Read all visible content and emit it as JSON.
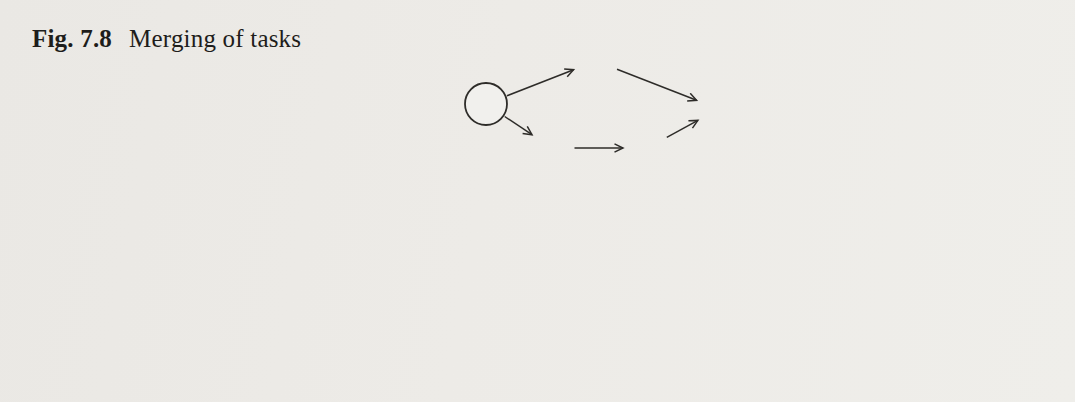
{
  "figure": {
    "label": "Fig. 7.8",
    "caption": "Merging of tasks"
  },
  "colors": {
    "paper": "#edebe7",
    "ink": "#2e2c29",
    "label_ink": "#232220",
    "caption_ink": "#1e1d1b",
    "ghost": "#8a8781"
  },
  "token_dot_radius": 7,
  "graphs": [
    {
      "id": "top-source",
      "nodes": [
        {
          "id": "t1",
          "kind": "task",
          "tau": "τ",
          "sub": "1",
          "sup": "",
          "x": 486,
          "y": 104,
          "r": 21
        },
        {
          "id": "t2",
          "kind": "task",
          "tau": "τ",
          "sub": "2",
          "sup": "",
          "x": 596,
          "y": 61,
          "r": 21
        },
        {
          "id": "t3",
          "kind": "task",
          "tau": "τ",
          "sub": "3",
          "sup": "",
          "x": 552,
          "y": 148,
          "r": 21
        },
        {
          "id": "t4",
          "kind": "task",
          "tau": "τ",
          "sub": "4",
          "sup": "",
          "x": 647,
          "y": 148,
          "r": 21
        },
        {
          "id": "t5",
          "kind": "task",
          "tau": "τ",
          "sub": "5",
          "sup": "",
          "x": 719,
          "y": 109,
          "r": 21
        }
      ],
      "edges": [
        [
          "t1",
          "t2"
        ],
        [
          "t1",
          "t3"
        ],
        [
          "t2",
          "t5"
        ],
        [
          "t3",
          "t4"
        ],
        [
          "t4",
          "t5"
        ]
      ]
    },
    {
      "id": "top-result",
      "nodes": [
        {
          "id": "t1",
          "kind": "task",
          "tau": "τ",
          "sub": "1",
          "sup": "",
          "x": 858,
          "y": 106,
          "r": 21
        },
        {
          "id": "t2",
          "kind": "task",
          "tau": "τ",
          "sub": "2",
          "sup": "",
          "x": 939,
          "y": 62,
          "r": 21
        },
        {
          "id": "t3s",
          "kind": "task",
          "tau": "τ",
          "sub": "3",
          "sup": "*",
          "x": 937,
          "y": 152,
          "r": 21
        },
        {
          "id": "t5",
          "kind": "task",
          "tau": "τ",
          "sub": "5",
          "sup": "",
          "x": 1017,
          "y": 107,
          "r": 21
        }
      ],
      "edges": [
        [
          "t1",
          "t2"
        ],
        [
          "t1",
          "t3s"
        ],
        [
          "t2",
          "t5"
        ],
        [
          "t3s",
          "t5"
        ]
      ]
    },
    {
      "id": "bottom-source",
      "nodes": [
        {
          "id": "token",
          "kind": "token",
          "x": 285,
          "y": 221,
          "r": 17
        },
        {
          "id": "t1",
          "kind": "task",
          "tau": "τ",
          "sub": "1",
          "sup": "",
          "x": 220,
          "y": 317,
          "r": 22
        },
        {
          "id": "t2",
          "kind": "task",
          "tau": "τ",
          "sub": "2",
          "sup": "",
          "x": 338,
          "y": 271,
          "r": 22
        },
        {
          "id": "t3",
          "kind": "task",
          "tau": "τ",
          "sub": "3",
          "sup": "",
          "x": 285,
          "y": 361,
          "r": 22
        },
        {
          "id": "t4",
          "kind": "task",
          "tau": "τ",
          "sub": "4",
          "sup": "",
          "x": 388,
          "y": 363,
          "r": 22
        },
        {
          "id": "t5",
          "kind": "task",
          "tau": "τ",
          "sub": "5",
          "sup": "",
          "x": 466,
          "y": 320,
          "r": 22
        }
      ],
      "edges": [
        [
          "token",
          "t2"
        ],
        [
          "t1",
          "t2"
        ],
        [
          "t1",
          "t3"
        ],
        [
          "t2",
          "t5"
        ],
        [
          "t3",
          "t4"
        ],
        [
          "t4",
          "t5"
        ]
      ]
    },
    {
      "id": "bottom-result",
      "nodes": [
        {
          "id": "token",
          "kind": "token",
          "x": 721,
          "y": 226,
          "r": 17
        },
        {
          "id": "t1",
          "kind": "task",
          "tau": "τ",
          "sub": "1",
          "sup": "",
          "x": 601,
          "y": 319,
          "r": 22
        },
        {
          "id": "t2s",
          "kind": "task",
          "tau": "τ",
          "sub": "2",
          "sup": "*",
          "x": 669,
          "y": 278,
          "r": 22
        },
        {
          "id": "t2ss",
          "kind": "task",
          "tau": "τ",
          "sub": "2",
          "sup": "**",
          "x": 771,
          "y": 279,
          "r": 22
        },
        {
          "id": "t3",
          "kind": "task",
          "tau": "τ",
          "sub": "3",
          "sup": "",
          "x": 668,
          "y": 367,
          "r": 22
        },
        {
          "id": "t4",
          "kind": "task",
          "tau": "τ",
          "sub": "4",
          "sup": "",
          "x": 767,
          "y": 366,
          "r": 22
        },
        {
          "id": "t5",
          "kind": "task",
          "tau": "τ",
          "sub": "5",
          "sup": "",
          "x": 846,
          "y": 322,
          "r": 22
        }
      ],
      "edges": [
        [
          "token",
          "t2ss"
        ],
        [
          "t1",
          "t2s"
        ],
        [
          "t2s",
          "t2ss"
        ],
        [
          "t2ss",
          "t5"
        ],
        [
          "t1",
          "t3"
        ],
        [
          "t3",
          "t4"
        ],
        [
          "t4",
          "t5"
        ]
      ]
    }
  ],
  "transform_arrows": [
    {
      "x1": 762,
      "y1": 108,
      "x2": 816,
      "y2": 108
    },
    {
      "x1": 511,
      "y1": 317,
      "x2": 566,
      "y2": 317
    }
  ],
  "bleedthrough": [
    {
      "x": 298,
      "y": 50,
      "size": 20,
      "text": "st al i nge can be so en at th a pans of ad t"
    },
    {
      "x": 2,
      "y": 79,
      "size": 19,
      "text": "virbl"
    },
    {
      "x": 428,
      "y": 76,
      "size": 20,
      "text": "e vol ae ot fo ines wr be ot bored"
    },
    {
      "x": 24,
      "y": 109,
      "size": 20,
      "text": "ad alt sed ha ka fo rm snb ave by Co a g rebal"
    },
    {
      "x": 18,
      "y": 142,
      "size": 20,
      "text": "de ard gas SzAL Pl ware by addiloal he scole"
    },
    {
      "x": 1040,
      "y": 55,
      "size": 16,
      "text": "mil"
    },
    {
      "x": 40,
      "y": 352,
      "size": 16,
      "text": "sh d p   te V   ie   el"
    },
    {
      "x": 25,
      "y": 388,
      "size": 17,
      "text": "ta d f le   a   ls   re   he d al   ed   sle   u"
    },
    {
      "x": 600,
      "y": 386,
      "size": 16,
      "text": "rte   al   ma s   el   d"
    }
  ]
}
